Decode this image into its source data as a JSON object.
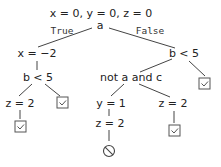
{
  "title": "x = 0, y = 0, z = 0",
  "root": {
    "label": "a"
  },
  "edge_labels": {
    "true": "True",
    "false": "False"
  },
  "nodes": {
    "left_assign": "x = −2",
    "left_cond": "b < 5",
    "left_left_assign": "z = 2",
    "right_cond": "b < 5",
    "right_inner_cond": "not a and c",
    "rl_assign_y": "y = 1",
    "rl_assign_z": "z = 2",
    "rr_assign_z": "z = 2"
  },
  "outcomes": {
    "left_left_result": "check-box-icon",
    "left_right_result": "check-box-icon",
    "right_right_result": "check-box-icon",
    "rr_result": "check-box-icon",
    "rl_result": "prohibited-icon"
  }
}
